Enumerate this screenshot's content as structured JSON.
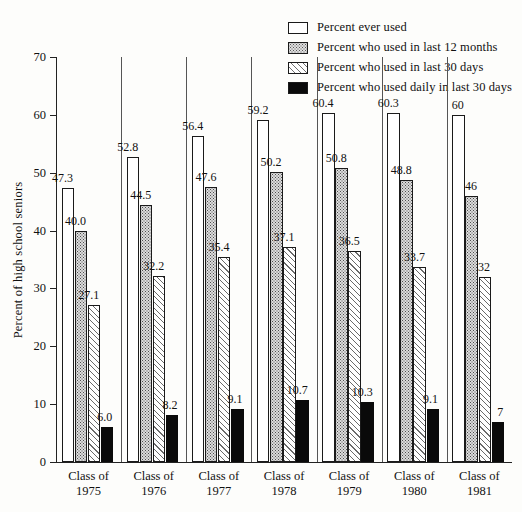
{
  "chart_data": {
    "type": "bar",
    "title": "",
    "subtitle": "",
    "xlabel": "",
    "ylabel": "Percent of high school seniors",
    "ylim": [
      0,
      70
    ],
    "yticks": [
      0,
      10,
      20,
      30,
      40,
      50,
      60,
      70
    ],
    "grid": false,
    "legend_position": "top-right",
    "categories": [
      "Class of 1975",
      "Class of 1976",
      "Class of 1977",
      "Class of 1978",
      "Class of 1979",
      "Class of 1980",
      "Class of 1981"
    ],
    "category_lines": [
      [
        "Class of",
        "1975"
      ],
      [
        "Class of",
        "1976"
      ],
      [
        "Class of",
        "1977"
      ],
      [
        "Class of",
        "1978"
      ],
      [
        "Class of",
        "1979"
      ],
      [
        "Class of",
        "1980"
      ],
      [
        "Class of",
        "1981"
      ]
    ],
    "series": [
      {
        "name": "Percent ever used",
        "pattern": "open-white",
        "values": [
          47.3,
          52.8,
          56.4,
          59.2,
          60.4,
          60.3,
          60
        ],
        "labels": [
          "47.3",
          "52.8",
          "56.4",
          "59.2",
          "60.4",
          "60.3",
          "60"
        ]
      },
      {
        "name": "Percent who used in last 12 months",
        "pattern": "stippled-gray",
        "values": [
          40.0,
          44.5,
          47.6,
          50.2,
          50.8,
          48.8,
          46
        ],
        "labels": [
          "40.0",
          "44.5",
          "47.6",
          "50.2",
          "50.8",
          "48.8",
          "46"
        ]
      },
      {
        "name": "Percent who used in last 30 days",
        "pattern": "diagonal-hatch",
        "values": [
          27.1,
          32.2,
          35.4,
          37.1,
          36.5,
          33.7,
          32
        ],
        "labels": [
          "27.1",
          "32.2",
          "35.4",
          "37.1",
          "36.5",
          "33.7",
          "32"
        ]
      },
      {
        "name": "Percent who used daily in last 30 days",
        "pattern": "solid-black",
        "values": [
          6.0,
          8.2,
          9.1,
          10.7,
          10.3,
          9.1,
          7
        ],
        "labels": [
          "6.0",
          "8.2",
          "9.1",
          "10.7",
          "10.3",
          "9.1",
          "7"
        ]
      }
    ]
  },
  "legend": {
    "items": [
      {
        "label": "Percent ever used",
        "swatch": "sw-ever"
      },
      {
        "label": "Percent who used in last 12 months",
        "swatch": "sw-12mo"
      },
      {
        "label": "Percent who used in last 30 days",
        "swatch": "sw-30d"
      },
      {
        "label": "Percent who used daily in last 30 days",
        "swatch": "sw-daily"
      }
    ]
  },
  "axes": {
    "y_title": "Percent of high school seniors",
    "y_tick_labels": [
      "0",
      "10",
      "20",
      "30",
      "40",
      "50",
      "60",
      "70"
    ]
  },
  "colors": {
    "ink": "#111111",
    "bar_outline": "#1a1a1a",
    "solid_bar": "#0a0a0a",
    "stipple_fill": "#dcdcdc",
    "background": "#fdfdfb"
  }
}
